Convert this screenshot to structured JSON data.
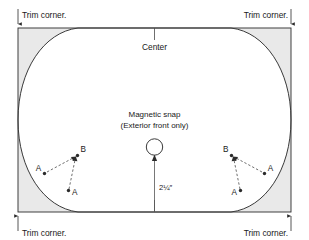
{
  "diagram": {
    "title_present": false,
    "canvas": {
      "width": 309,
      "height": 240
    },
    "colors": {
      "stroke": "#2b2b2b",
      "curve": "#3a3a3a",
      "corner_shade": "#e9e9e9",
      "background": "#ffffff",
      "text": "#1a1a1a"
    },
    "labels": {
      "trim_corner_top_left": "Trim corner.",
      "trim_corner_top_right": "Trim corner.",
      "trim_corner_bottom_left": "Trim corner.",
      "trim_corner_bottom_right": "Trim corner.",
      "center": "Center",
      "snap_line1": "Magnetic snap",
      "snap_line2": "(Exterior front only)",
      "dimension": "2¼″"
    },
    "points": {
      "left_group": [
        {
          "id": "A-upper-left",
          "label": "A"
        },
        {
          "id": "B-left",
          "label": "B"
        },
        {
          "id": "A-lower-left",
          "label": "A"
        }
      ],
      "right_group": [
        {
          "id": "B-right",
          "label": "B"
        },
        {
          "id": "A-upper-right",
          "label": "A"
        },
        {
          "id": "A-lower-right",
          "label": "A"
        }
      ]
    },
    "annotations": {
      "corner_markers": 4,
      "center_ticks": 2,
      "snap_count": 1
    }
  }
}
